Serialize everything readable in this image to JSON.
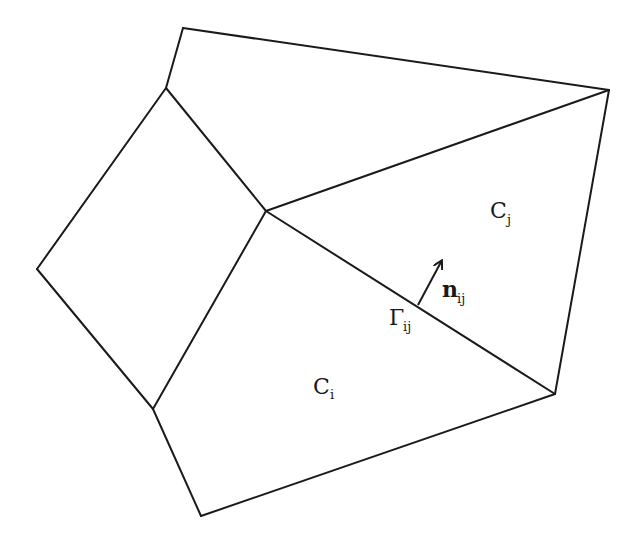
{
  "diagram": {
    "stroke_color": "#1a1a1a",
    "background_color": "#ffffff",
    "labels": {
      "cell_i": {
        "main": "C",
        "sub": "i"
      },
      "cell_j": {
        "main": "C",
        "sub": "j"
      },
      "face": {
        "main": "Γ",
        "sub": "ij"
      },
      "normal": {
        "main": "n",
        "sub": "ij"
      }
    },
    "vertices": {
      "A": [
        183,
        28
      ],
      "B": [
        166,
        88
      ],
      "C": [
        609,
        90
      ],
      "D": [
        266,
        211
      ],
      "E": [
        37,
        269
      ],
      "F": [
        153,
        409
      ],
      "G": [
        555,
        394
      ],
      "H": [
        201,
        516
      ]
    },
    "edges": [
      [
        "A",
        "C"
      ],
      [
        "A",
        "B"
      ],
      [
        "B",
        "D"
      ],
      [
        "B",
        "E"
      ],
      [
        "E",
        "F"
      ],
      [
        "F",
        "D"
      ],
      [
        "D",
        "C"
      ],
      [
        "C",
        "G"
      ],
      [
        "D",
        "G"
      ],
      [
        "F",
        "H"
      ],
      [
        "H",
        "G"
      ]
    ]
  }
}
